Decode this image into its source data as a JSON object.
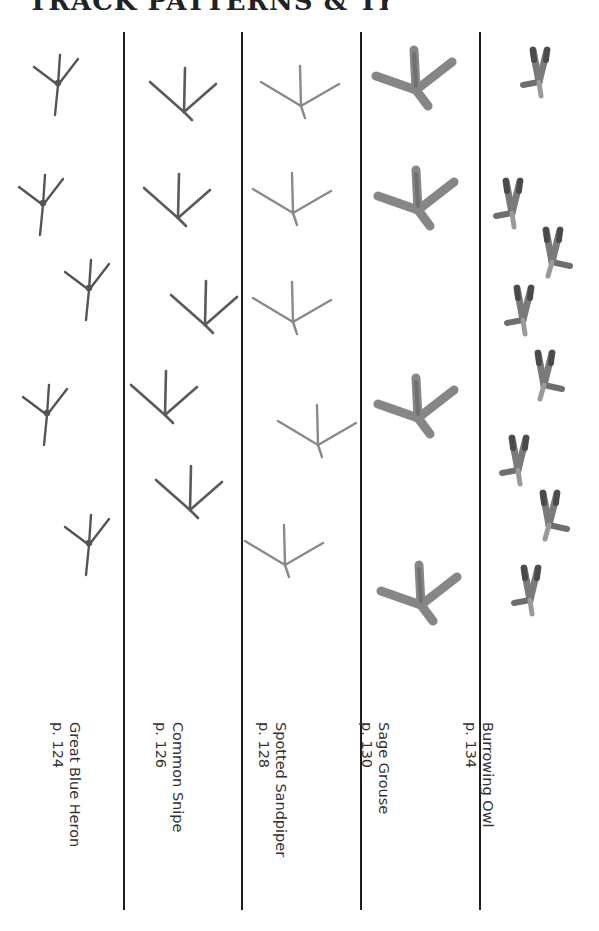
{
  "page": {
    "title_visible": "cropped",
    "title": "TRACK PATTERNS & TRAILS"
  },
  "columns": [
    {
      "species": "Great Blue Heron",
      "page": "p. 124",
      "track_style": "thin-heron",
      "track_count": 4
    },
    {
      "species": "Common Snipe",
      "page": "p. 126",
      "track_style": "thin-snipe",
      "track_count": 4
    },
    {
      "species": "Spotted Sandpiper",
      "page": "p. 128",
      "track_style": "thin-sandpiper",
      "track_count": 4
    },
    {
      "species": "Sage Grouse",
      "page": "p. 130",
      "track_style": "thick-grouse",
      "track_count": 4
    },
    {
      "species": "Burrowing Owl",
      "page": "p. 134",
      "track_style": "zygodactyl-owl",
      "track_count": 8
    }
  ],
  "colors": {
    "track_dark": "#555555",
    "track_light": "#8a8a8a",
    "divider": "#1e1e1e",
    "text": "#333333"
  }
}
